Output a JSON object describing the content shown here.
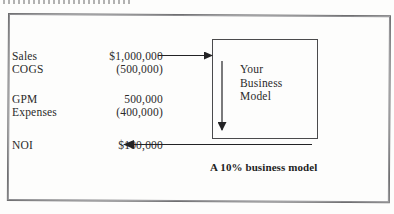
{
  "figure": {
    "caption": "A 10% business model",
    "model_box_lines": [
      "Your",
      "Business",
      "Model"
    ],
    "statement": {
      "rows": [
        {
          "label": "Sales",
          "value": "$1,000,000"
        },
        {
          "label": "COGS",
          "value": "(500,000)"
        },
        {
          "label": "GPM",
          "value": "500,000"
        },
        {
          "label": "Expenses",
          "value": "(400,000)"
        },
        {
          "label": "NOI",
          "value": "$100,000"
        }
      ]
    },
    "colors": {
      "ink": "#2a2a2a",
      "rule": "#4a4a4c",
      "frame": "#6f6f71",
      "page": "#fdfdfc"
    }
  }
}
